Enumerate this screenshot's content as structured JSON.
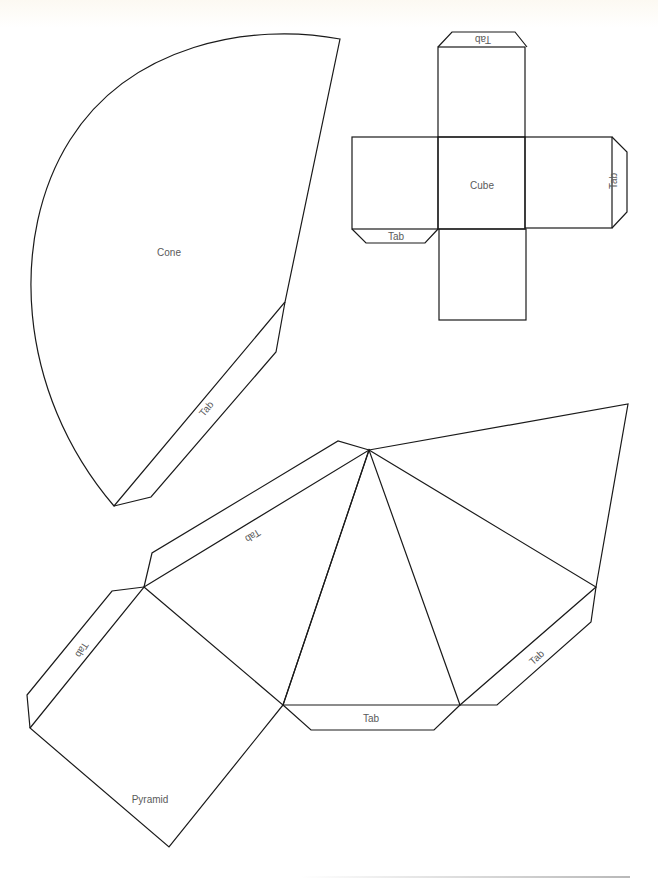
{
  "shapes": {
    "cone": {
      "label": "Cone",
      "tab_label": "Tab"
    },
    "cube": {
      "label": "Cube",
      "tabs": [
        {
          "position": "top",
          "label": "Tab"
        },
        {
          "position": "right",
          "label": "Tab"
        },
        {
          "position": "left-bottom",
          "label": "Tab"
        }
      ]
    },
    "pyramid": {
      "label": "Pyramid",
      "tabs": [
        {
          "position": "upper-left",
          "label": "Tab"
        },
        {
          "position": "left",
          "label": "Tab"
        },
        {
          "position": "bottom",
          "label": "Tab"
        },
        {
          "position": "right",
          "label": "Tab"
        }
      ]
    }
  },
  "colors": {
    "line": "#1a1a1a",
    "label": "#5a5a5a",
    "paper": "#ffffff"
  }
}
